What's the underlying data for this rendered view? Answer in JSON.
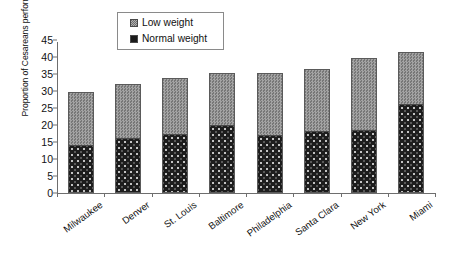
{
  "chart_data": {
    "type": "bar",
    "stacked": true,
    "title": "",
    "xlabel": "",
    "ylabel": "Proportion of Cesareans performed (%)",
    "ylim": [
      0,
      45
    ],
    "ytick_labels": [
      "0",
      "5",
      "10",
      "15",
      "20",
      "25",
      "30",
      "35",
      "40",
      "45"
    ],
    "ytick_values": [
      0,
      5,
      10,
      15,
      20,
      25,
      30,
      35,
      40,
      45
    ],
    "grid": false,
    "legend_position": "top-center",
    "categories": [
      "Milwaukee",
      "Denver",
      "St. Louis",
      "Baltimore",
      "Philadelphia",
      "Santa Clara",
      "New York",
      "Miami"
    ],
    "series": [
      {
        "name": "Normal weight",
        "color": "#1d1d1d",
        "pattern": "dotted",
        "values": [
          13.8,
          16.0,
          17.0,
          19.8,
          16.8,
          18.0,
          18.3,
          26.0
        ]
      },
      {
        "name": "Low weight",
        "color": "#8d8d8d",
        "pattern": "checkered",
        "values": [
          16.0,
          16.0,
          16.7,
          15.4,
          18.5,
          18.5,
          21.5,
          15.5
        ]
      }
    ],
    "totals": [
      29.8,
      32.0,
      33.7,
      35.2,
      35.3,
      36.5,
      39.8,
      41.5
    ]
  },
  "legend": {
    "entries": [
      {
        "label": "Low weight",
        "swatch": "low"
      },
      {
        "label": "Normal weight",
        "swatch": "normal"
      }
    ]
  }
}
